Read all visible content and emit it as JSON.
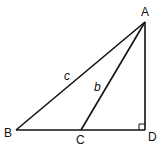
{
  "diagram": {
    "points": {
      "A": {
        "label": "A",
        "x": 145,
        "y": 22
      },
      "B": {
        "label": "B",
        "x": 16,
        "y": 130
      },
      "C": {
        "label": "C",
        "x": 81,
        "y": 130
      },
      "D": {
        "label": "D",
        "x": 145,
        "y": 130
      }
    },
    "segments": [
      {
        "from": "A",
        "to": "B",
        "label": "c"
      },
      {
        "from": "A",
        "to": "C",
        "label": "b"
      },
      {
        "from": "A",
        "to": "D",
        "label": ""
      },
      {
        "from": "B",
        "to": "D",
        "label": ""
      }
    ],
    "labels": {
      "A": "A",
      "B": "B",
      "C": "C",
      "D": "D",
      "c": "c",
      "b": "b"
    },
    "right_angle_at": "D",
    "stroke_color": "#111111",
    "background": "#ffffff"
  }
}
